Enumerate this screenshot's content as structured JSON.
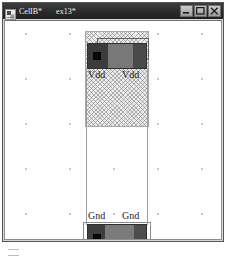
{
  "window": {
    "app_icon": "layout-app-icon",
    "doc_title": "CelIB*",
    "view_title": "ex13*",
    "buttons": {
      "minimize": {
        "name": "minimize-button",
        "glyph": "minimize-icon"
      },
      "maximize": {
        "name": "maximize-button",
        "glyph": "maximize-icon"
      },
      "close": {
        "name": "close-button",
        "glyph": "close-icon"
      }
    }
  },
  "canvas": {
    "grid": "dot-grid",
    "shapes": {
      "instance_top": "hatched-instance-region",
      "outline_top": "thin-outline-rectangle",
      "metal_vdd": "vdd-metal-rail",
      "pin_vdd": "vdd-pin-square",
      "cell_boundary": "cell-boundary-rectangle",
      "metal_gnd": "gnd-metal-rail",
      "pin_gnd": "gnd-pin-square",
      "outline_bottom": "abut-outline-rectangle"
    },
    "labels": {
      "vdd_left": "Vdd",
      "vdd_right": "Vdd",
      "gnd_left": "Gnd",
      "gnd_right": "Gnd",
      "abut": "Abut"
    }
  },
  "figure": {
    "caption": ""
  },
  "colors": {
    "title_bar": "#2b2b2b",
    "window_face": "#d9d9d9",
    "canvas": "#ffffff",
    "metal_dark": "#3c3c3c",
    "metal_light": "#787878",
    "pin": "#090909",
    "grid_dot": "#9b9b9b",
    "hatch": "#787878"
  }
}
